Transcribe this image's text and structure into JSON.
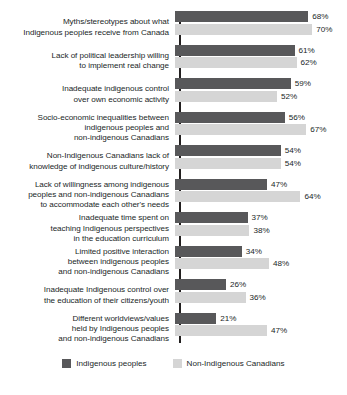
{
  "chart_data": {
    "type": "bar",
    "orientation": "horizontal",
    "title": "",
    "subtitle": "",
    "xlabel": "",
    "ylabel": "",
    "xlim": [
      0,
      70
    ],
    "grid": false,
    "legend_position": "bottom",
    "value_suffix": "%",
    "categories": [
      "Myths/stereotypes about what indigenous peoples receive from Canada",
      "Lack of political leadership willing to implement real change",
      "Inadequate indigenous control over own economic activity",
      "Socio-economic inequalities between indigenous peoples and non-indigenous Canadians",
      "Non-Indigenous Canadians lack of knowledge of indigenous culture/history",
      "Lack of willingness among indigenous peoples and non-indigenous Canadians to accommodate each other's needs",
      "Inadequate time spent on teaching Indigenous perspectives in the education curriculum",
      "Limited positive interaction between indigenous peoples and non-indigenous Canadians",
      "Inadequate Indigenous control over the education of their citizens/youth",
      "Different worldviews/values held by Indigenous peoples and non-indigenous Canadians"
    ],
    "category_lines": [
      [
        "Myths/stereotypes about what",
        "Indigenous peoples receive from Canada"
      ],
      [
        "Lack of political leadership willing",
        "to implement real change"
      ],
      [
        "Inadequate indigenous control",
        "over own economic activity"
      ],
      [
        "Socio-economic inequalities between",
        "indigenous peoples and",
        "non-indigenous Canadians"
      ],
      [
        "Non-Indigenous Canadians lack of",
        "knowledge of indigenous culture/history"
      ],
      [
        "Lack of willingness among indigenous",
        "peoples and non-indigenous Canadians",
        "to accommodate each other's needs"
      ],
      [
        "Inadequate time spent on",
        "teaching Indigenous perspectives",
        "in the education curriculum"
      ],
      [
        "Limited positive interaction",
        "between indigenous peoples",
        "and non-indigenous Canadians"
      ],
      [
        "Inadequate Indigenous control over",
        "the education of their citizens/youth"
      ],
      [
        "Different worldviews/values",
        "held by Indigenous peoples",
        "and non-indigenous Canadians"
      ]
    ],
    "series": [
      {
        "name": "Indigenous peoples",
        "color": "#58585a",
        "values": [
          68,
          61,
          59,
          56,
          54,
          47,
          37,
          34,
          26,
          21
        ],
        "labels": [
          "68%",
          "61%",
          "59%",
          "56%",
          "54%",
          "47%",
          "37%",
          "34%",
          "26%",
          "21%"
        ]
      },
      {
        "name": "Non-Indigenous Canadians",
        "color": "#d5d5d5",
        "values": [
          70,
          62,
          52,
          67,
          54,
          64,
          38,
          48,
          36,
          47
        ],
        "labels": [
          "70%",
          "62%",
          "52%",
          "67%",
          "54%",
          "64%",
          "38%",
          "48%",
          "36%",
          "47%"
        ]
      }
    ]
  },
  "legend": {
    "items": [
      {
        "label": "Indigenous peoples",
        "color": "#58585a"
      },
      {
        "label": "Non-Indigenous Canadians",
        "color": "#d5d5d5"
      }
    ]
  }
}
